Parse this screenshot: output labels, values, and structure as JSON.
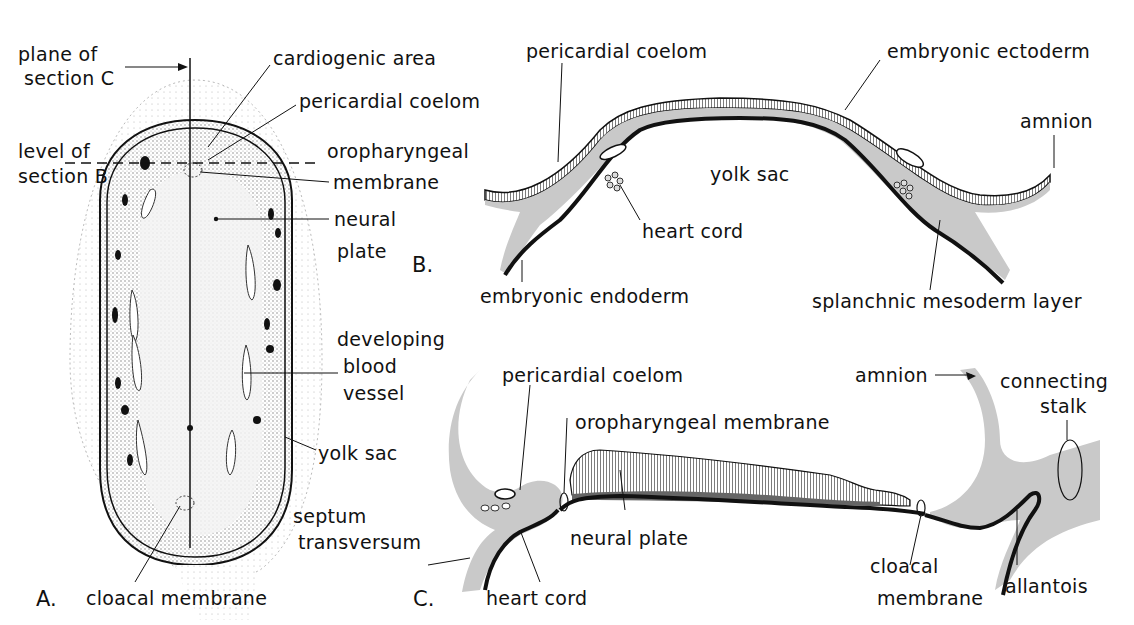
{
  "figure": {
    "panels": [
      {
        "id": "A",
        "label": "A."
      },
      {
        "id": "B",
        "label": "B."
      },
      {
        "id": "C",
        "label": "C."
      }
    ],
    "colors": {
      "ink": "#111111",
      "mesoderm_gray": "#c8c8c8",
      "stipple": "#9a9a9a",
      "background": "#ffffff"
    }
  },
  "panel_a": {
    "labels": {
      "plane_c": [
        "plane of",
        "section C"
      ],
      "level_b": [
        "level of",
        "section B"
      ],
      "cardiogenic": "cardiogenic area",
      "pericardial": "pericardial coelom",
      "oropharyngeal": [
        "oropharyngeal",
        "membrane"
      ],
      "neural_plate": [
        "neural",
        "plate"
      ],
      "blood_vessel": [
        "developing",
        "blood",
        "vessel"
      ],
      "yolk_sac": "yolk sac",
      "cloacal": "cloacal membrane"
    }
  },
  "panel_b": {
    "labels": {
      "pericardial": "pericardial coelom",
      "ectoderm": "embryonic ectoderm",
      "amnion": "amnion",
      "yolk_sac": "yolk sac",
      "heart_cord": "heart cord",
      "endoderm": "embryonic endoderm",
      "splanchnic": "splanchnic mesoderm layer"
    }
  },
  "panel_c": {
    "labels": {
      "pericardial": "pericardial coelom",
      "amnion": "amnion",
      "connecting_stalk": [
        "connecting",
        "stalk"
      ],
      "oropharyngeal": "oropharyngeal membrane",
      "septum": [
        "septum",
        "transversum"
      ],
      "neural_plate": "neural plate",
      "heart_cord": "heart cord",
      "cloacal": [
        "cloacal",
        "membrane"
      ],
      "allantois": "allantois"
    }
  }
}
